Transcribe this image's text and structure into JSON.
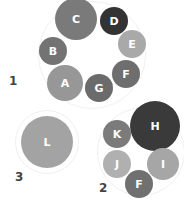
{
  "groups": [
    {
      "label": "1",
      "x": 9,
      "y": 74,
      "ring": {
        "cx": 92,
        "cy": 55,
        "r": 54
      },
      "nodes": [
        {
          "label": "C",
          "cx": 76,
          "cy": 19,
          "r": 21,
          "color": "#7a7a7a"
        },
        {
          "label": "D",
          "cx": 114,
          "cy": 21,
          "r": 14,
          "color": "#333333"
        },
        {
          "label": "E",
          "cx": 132,
          "cy": 44,
          "r": 14,
          "color": "#a9a9a9"
        },
        {
          "label": "B",
          "cx": 53,
          "cy": 51,
          "r": 14,
          "color": "#737373"
        },
        {
          "label": "A",
          "cx": 65,
          "cy": 83,
          "r": 18,
          "color": "#979797"
        },
        {
          "label": "G",
          "cx": 99,
          "cy": 88,
          "r": 14,
          "color": "#6b6b6b"
        },
        {
          "label": "F",
          "cx": 126,
          "cy": 74,
          "r": 14,
          "color": "#6e6e6e"
        }
      ]
    },
    {
      "label": "2",
      "x": 99,
      "y": 181,
      "ring": {
        "cx": 141,
        "cy": 152,
        "r": 44
      },
      "nodes": [
        {
          "label": "H",
          "cx": 155,
          "cy": 126,
          "r": 25,
          "color": "#3a3a3a"
        },
        {
          "label": "K",
          "cx": 117,
          "cy": 134,
          "r": 14,
          "color": "#7b7b7b"
        },
        {
          "label": "J",
          "cx": 117,
          "cy": 164,
          "r": 14,
          "color": "#b0b0b0"
        },
        {
          "label": "I",
          "cx": 163,
          "cy": 164,
          "r": 16,
          "color": "#a6a6a6"
        },
        {
          "label": "F",
          "cx": 139,
          "cy": 184,
          "r": 14,
          "color": "#707070"
        }
      ]
    },
    {
      "label": "3",
      "x": 15,
      "y": 170,
      "ring": {
        "cx": 47,
        "cy": 142,
        "r": 32
      },
      "nodes": [
        {
          "label": "L",
          "cx": 47,
          "cy": 142,
          "r": 26,
          "color": "#a3a3a3"
        }
      ]
    }
  ]
}
